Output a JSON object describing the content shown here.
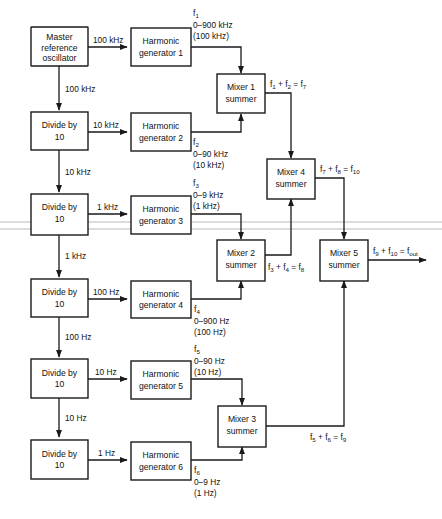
{
  "diagram": {
    "background_color": "#ffffff",
    "line_color": "#1a1a1a",
    "blocks": {
      "master_oscillator": {
        "line1": "Master",
        "line2": "reference",
        "line3": "oscillator"
      },
      "divider_1": {
        "line1": "Divide by",
        "line2": "10"
      },
      "divider_2": {
        "line1": "Divide by",
        "line2": "10"
      },
      "divider_3": {
        "line1": "Divide by",
        "line2": "10"
      },
      "divider_4": {
        "line1": "Divide by",
        "line2": "10"
      },
      "divider_5": {
        "line1": "Divide by",
        "line2": "10"
      },
      "harmonic_gen_1": {
        "line1": "Harmonic",
        "line2": "generator 1"
      },
      "harmonic_gen_2": {
        "line1": "Harmonic",
        "line2": "generator 2"
      },
      "harmonic_gen_3": {
        "line1": "Harmonic",
        "line2": "generator 3"
      },
      "harmonic_gen_4": {
        "line1": "Harmonic",
        "line2": "generator 4"
      },
      "harmonic_gen_5": {
        "line1": "Harmonic",
        "line2": "generator 5"
      },
      "harmonic_gen_6": {
        "line1": "Harmonic",
        "line2": "generator 6"
      },
      "mixer_1": {
        "line1": "Mixer 1",
        "line2": "summer"
      },
      "mixer_2": {
        "line1": "Mixer 2",
        "line2": "summer"
      },
      "mixer_3": {
        "line1": "Mixer 3",
        "line2": "summer"
      },
      "mixer_4": {
        "line1": "Mixer 4",
        "line2": "summer"
      },
      "mixer_5": {
        "line1": "Mixer 5",
        "line2": "summer"
      }
    },
    "wire_labels": {
      "osc_to_gen1": "100 kHz",
      "osc_to_div1": "100 kHz",
      "div1_to_gen2": "10 kHz",
      "div1_to_div2": "10 kHz",
      "div2_to_gen3": "1 kHz",
      "div2_to_div3": "1 kHz",
      "div3_to_gen4": "100 Hz",
      "div3_to_div4": "100 Hz",
      "div4_to_gen5": "10 Hz",
      "div4_to_div5": "10 Hz",
      "div5_to_gen6": "1 Hz"
    },
    "frequency_labels": {
      "f1": {
        "symbol": "f",
        "index": "1",
        "range": "0–900 kHz",
        "step": "(100 kHz)"
      },
      "f2": {
        "symbol": "f",
        "index": "2",
        "range": "0–90 kHz",
        "step": "(10 kHz)"
      },
      "f3": {
        "symbol": "f",
        "index": "3",
        "range": "0–9 kHz",
        "step": "(1 kHz)"
      },
      "f4": {
        "symbol": "f",
        "index": "4",
        "range": "0–900 Hz",
        "step": "(100 Hz)"
      },
      "f5": {
        "symbol": "f",
        "index": "5",
        "range": "0–90 Hz",
        "step": "(10 Hz)"
      },
      "f6": {
        "symbol": "f",
        "index": "6",
        "range": "0–9 Hz",
        "step": "(1 Hz)"
      }
    },
    "mixer_outputs": {
      "mixer_1": {
        "a": "f",
        "a_sub": "1",
        "b": "f",
        "b_sub": "2",
        "r": "f",
        "r_sub": "7"
      },
      "mixer_2": {
        "a": "f",
        "a_sub": "3",
        "b": "f",
        "b_sub": "4",
        "r": "f",
        "r_sub": "8"
      },
      "mixer_3": {
        "a": "f",
        "a_sub": "5",
        "b": "f",
        "b_sub": "6",
        "r": "f",
        "r_sub": "9"
      },
      "mixer_4": {
        "a": "f",
        "a_sub": "7",
        "b": "f",
        "b_sub": "8",
        "r": "f",
        "r_sub": "10"
      },
      "mixer_5": {
        "a": "f",
        "a_sub": "9",
        "b": "f",
        "b_sub": "10",
        "r": "f",
        "r_sub": "out"
      }
    }
  }
}
